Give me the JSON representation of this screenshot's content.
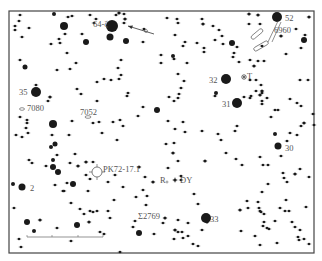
{
  "chart": {
    "type": "star-chart",
    "frame": {
      "x": 9,
      "y": 11,
      "width": 305,
      "height": 242,
      "stroke": "#444444"
    },
    "star_color": "#1a1a1a",
    "label_color": "#555555",
    "scale_bar": {
      "x1": 27,
      "x2": 103,
      "y": 237,
      "ticks": [
        27,
        52,
        78,
        103
      ]
    }
  },
  "labels": [
    {
      "id": "64-zeta",
      "text": "64-ζ",
      "x": 93,
      "y": 27
    },
    {
      "id": "52",
      "text": "52",
      "x": 285,
      "y": 21
    },
    {
      "id": "6960",
      "text": "6960",
      "x": 274,
      "y": 33
    },
    {
      "id": "35",
      "text": "35",
      "x": 19,
      "y": 95
    },
    {
      "id": "7080",
      "text": "7080",
      "x": 27,
      "y": 111
    },
    {
      "id": "7052",
      "text": "7052",
      "x": 80,
      "y": 115
    },
    {
      "id": "32",
      "text": "32",
      "x": 209,
      "y": 83
    },
    {
      "id": "T",
      "text": "T",
      "x": 247,
      "y": 79
    },
    {
      "id": "31",
      "text": "31",
      "x": 222,
      "y": 107
    },
    {
      "id": "30",
      "text": "30",
      "x": 285,
      "y": 151
    },
    {
      "id": "2",
      "text": "2",
      "x": 30,
      "y": 191
    },
    {
      "id": "PK72-17.1",
      "text": "PK72-17.1",
      "x": 103,
      "y": 172
    },
    {
      "id": "R",
      "text": "R",
      "x": 160,
      "y": 183
    },
    {
      "id": "DY",
      "text": "DY",
      "x": 180,
      "y": 183
    },
    {
      "id": "Sigma2769",
      "text": "Σ2769",
      "x": 138,
      "y": 219
    },
    {
      "id": "33",
      "text": "33",
      "x": 210,
      "y": 222
    }
  ],
  "stars": [
    [
      20,
      15,
      1.2
    ],
    [
      19,
      21,
      1.2
    ],
    [
      15,
      26,
      1.2
    ],
    [
      15,
      30,
      1.2
    ],
    [
      29,
      28,
      1.2
    ],
    [
      22,
      37,
      1.2
    ],
    [
      54,
      14,
      2
    ],
    [
      68,
      17,
      1.2
    ],
    [
      72,
      16,
      1.2
    ],
    [
      64,
      26,
      4
    ],
    [
      65,
      34,
      1.2
    ],
    [
      90,
      15,
      1.2
    ],
    [
      96,
      19,
      1.2
    ],
    [
      94,
      23,
      1.2
    ],
    [
      112,
      26,
      6
    ],
    [
      110,
      37,
      3.5
    ],
    [
      119,
      13,
      1.5
    ],
    [
      116,
      15,
      1.2
    ],
    [
      124,
      14,
      1.2
    ],
    [
      125,
      19,
      1.5
    ],
    [
      124,
      23,
      1.2
    ],
    [
      126,
      41,
      3
    ],
    [
      144,
      29,
      1.2
    ],
    [
      143,
      42,
      1.2
    ],
    [
      86,
      42,
      3
    ],
    [
      82,
      34,
      1.2
    ],
    [
      51,
      44,
      1.2
    ],
    [
      60,
      43,
      1.2
    ],
    [
      59,
      39,
      1.2
    ],
    [
      67,
      53,
      1.2
    ],
    [
      76,
      63,
      1.2
    ],
    [
      70,
      69,
      1.2
    ],
    [
      57,
      70,
      1.2
    ],
    [
      20,
      60,
      1.2
    ],
    [
      25,
      67,
      2.5
    ],
    [
      121,
      60,
      1.2
    ],
    [
      118,
      68,
      1.2
    ],
    [
      121,
      75,
      1.2
    ],
    [
      119,
      79,
      1.2
    ],
    [
      111,
      80,
      1.2
    ],
    [
      104,
      79,
      1.2
    ],
    [
      97,
      82,
      1.2
    ],
    [
      36,
      85,
      1.2
    ],
    [
      36,
      92,
      5
    ],
    [
      50,
      97,
      1.5
    ],
    [
      48,
      101,
      1.2
    ],
    [
      77,
      89,
      1.2
    ],
    [
      81,
      94,
      1.2
    ],
    [
      128,
      93,
      1.2
    ],
    [
      127,
      96,
      1.2
    ],
    [
      97,
      101,
      1.2
    ],
    [
      143,
      107,
      1.2
    ],
    [
      138,
      116,
      1.2
    ],
    [
      157,
      110,
      3
    ],
    [
      166,
      7,
      1.2
    ],
    [
      167,
      18,
      1.2
    ],
    [
      177,
      19,
      1.2
    ],
    [
      178,
      23,
      1.2
    ],
    [
      202,
      19,
      1.2
    ],
    [
      203,
      24,
      1.5
    ],
    [
      213,
      26,
      1.2
    ],
    [
      175,
      35,
      1.2
    ],
    [
      185,
      42,
      1.2
    ],
    [
      183,
      46,
      1.2
    ],
    [
      197,
      43,
      1.2
    ],
    [
      204,
      48,
      1.2
    ],
    [
      204,
      52,
      1.2
    ],
    [
      173,
      56,
      2
    ],
    [
      174,
      59,
      1.2
    ],
    [
      187,
      63,
      1.2
    ],
    [
      161,
      55,
      1.2
    ],
    [
      161,
      63,
      1.2
    ],
    [
      178,
      74,
      1.2
    ],
    [
      184,
      81,
      1.2
    ],
    [
      181,
      88,
      1.2
    ],
    [
      179,
      94,
      1.2
    ],
    [
      178,
      98,
      1.2
    ],
    [
      174,
      101,
      1.2
    ],
    [
      169,
      97,
      1.2
    ],
    [
      215,
      40,
      1.2
    ],
    [
      232,
      43,
      3
    ],
    [
      237,
      47,
      1.2
    ],
    [
      234,
      53,
      1.2
    ],
    [
      233,
      57,
      1.2
    ],
    [
      239,
      62,
      1.2
    ],
    [
      219,
      30,
      1.2
    ],
    [
      222,
      36,
      1.2
    ],
    [
      223,
      44,
      1.2
    ],
    [
      249,
      14,
      1.5
    ],
    [
      258,
      15,
      1.5
    ],
    [
      249,
      24,
      1.2
    ],
    [
      260,
      24,
      1.2
    ],
    [
      277,
      17,
      5
    ],
    [
      309,
      17,
      1.5
    ],
    [
      296,
      29,
      1.2
    ],
    [
      281,
      36,
      1.5
    ],
    [
      262,
      46,
      1.2
    ],
    [
      305,
      35,
      1.2
    ],
    [
      304,
      40,
      3
    ],
    [
      301,
      48,
      1.2
    ],
    [
      286,
      54,
      1.2
    ],
    [
      250,
      60,
      1.2
    ],
    [
      254,
      66,
      1.5
    ],
    [
      258,
      61,
      1.2
    ],
    [
      264,
      61,
      1.2
    ],
    [
      250,
      80,
      1.2
    ],
    [
      256,
      80,
      1.2
    ],
    [
      261,
      85,
      1.2
    ],
    [
      262,
      91,
      1.5
    ],
    [
      260,
      95,
      1.5
    ],
    [
      262,
      93,
      1.2
    ],
    [
      226,
      79,
      5
    ],
    [
      216,
      93,
      2
    ],
    [
      215,
      96,
      1.2
    ],
    [
      237,
      103,
      5
    ],
    [
      244,
      97,
      1.2
    ],
    [
      250,
      98,
      1.2
    ],
    [
      251,
      96,
      1.2
    ],
    [
      256,
      91,
      1.2
    ],
    [
      267,
      98,
      1.2
    ],
    [
      262,
      104,
      1.2
    ],
    [
      262,
      101,
      1.2
    ],
    [
      300,
      80,
      1.2
    ],
    [
      308,
      80,
      1.2
    ],
    [
      301,
      106,
      1.2
    ],
    [
      297,
      103,
      1.2
    ],
    [
      290,
      99,
      1.2
    ],
    [
      275,
      110,
      1.2
    ],
    [
      313,
      114,
      1.2
    ],
    [
      314,
      125,
      1.2
    ],
    [
      20,
      117,
      1.2
    ],
    [
      27,
      120,
      1.2
    ],
    [
      27,
      123,
      1.2
    ],
    [
      26,
      128,
      1.2
    ],
    [
      53,
      124,
      4
    ],
    [
      72,
      121,
      1.2
    ],
    [
      93,
      123,
      1.2
    ],
    [
      99,
      122,
      1.2
    ],
    [
      113,
      122,
      1.2
    ],
    [
      120,
      120,
      1.2
    ],
    [
      123,
      126,
      1.2
    ],
    [
      168,
      121,
      1.2
    ],
    [
      175,
      129,
      1.2
    ],
    [
      183,
      122,
      1.2
    ],
    [
      271,
      117,
      1.2
    ],
    [
      278,
      110,
      1.2
    ],
    [
      304,
      123,
      1.5
    ],
    [
      301,
      126,
      1.2
    ],
    [
      297,
      135,
      1.2
    ],
    [
      237,
      126,
      1.2
    ],
    [
      16,
      135,
      1.2
    ],
    [
      22,
      137,
      1.2
    ],
    [
      28,
      133,
      1.2
    ],
    [
      52,
      135,
      1.2
    ],
    [
      69,
      135,
      1.2
    ],
    [
      55,
      144,
      2.5
    ],
    [
      102,
      133,
      1.2
    ],
    [
      117,
      140,
      1.2
    ],
    [
      51,
      147,
      2
    ],
    [
      75,
      154,
      1.2
    ],
    [
      57,
      155,
      1.2
    ],
    [
      53,
      160,
      2
    ],
    [
      86,
      162,
      1.5
    ],
    [
      29,
      160,
      1.2
    ],
    [
      32,
      163,
      1.2
    ],
    [
      46,
      166,
      1.2
    ],
    [
      78,
      166,
      1.5
    ],
    [
      53,
      167,
      3
    ],
    [
      58,
      172,
      3
    ],
    [
      70,
      163,
      1.2
    ],
    [
      86,
      175,
      1.2
    ],
    [
      90,
      179,
      1.2
    ],
    [
      55,
      185,
      1.2
    ],
    [
      67,
      183,
      1.2
    ],
    [
      73,
      183,
      1.2
    ],
    [
      73,
      184,
      3
    ],
    [
      63,
      191,
      1.2
    ],
    [
      13,
      184,
      2
    ],
    [
      22,
      187,
      3.5
    ],
    [
      64,
      191,
      1.2
    ],
    [
      88,
      191,
      1.2
    ],
    [
      108,
      182,
      1.2
    ],
    [
      115,
      175,
      1.2
    ],
    [
      123,
      187,
      1.2
    ],
    [
      139,
      167,
      1.5
    ],
    [
      145,
      177,
      1.2
    ],
    [
      153,
      182,
      1.5
    ],
    [
      143,
      190,
      1.2
    ],
    [
      147,
      196,
      1.2
    ],
    [
      136,
      197,
      1.2
    ],
    [
      146,
      205,
      1.2
    ],
    [
      93,
      162,
      1.2
    ],
    [
      71,
      203,
      1.2
    ],
    [
      80,
      209,
      1.2
    ],
    [
      90,
      211,
      1.2
    ],
    [
      84,
      214,
      1.2
    ],
    [
      93,
      212,
      1.2
    ],
    [
      97,
      211,
      1.2
    ],
    [
      108,
      211,
      1.2
    ],
    [
      114,
      200,
      1.2
    ],
    [
      14,
      208,
      1.2
    ],
    [
      27,
      222,
      3
    ],
    [
      40,
      220,
      1.5
    ],
    [
      34,
      231,
      2
    ],
    [
      57,
      228,
      1.2
    ],
    [
      77,
      225,
      3
    ],
    [
      89,
      222,
      1.5
    ],
    [
      110,
      218,
      1.2
    ],
    [
      100,
      232,
      1.2
    ],
    [
      104,
      234,
      1.2
    ],
    [
      19,
      239,
      1.2
    ],
    [
      21,
      247,
      1.2
    ],
    [
      15,
      255,
      1.2
    ],
    [
      25,
      258,
      1.2
    ],
    [
      71,
      241,
      1.2
    ],
    [
      120,
      252,
      1.2
    ],
    [
      166,
      144,
      1.2
    ],
    [
      174,
      143,
      1.2
    ],
    [
      185,
      132,
      1.2
    ],
    [
      202,
      131,
      1.2
    ],
    [
      218,
      134,
      1.2
    ],
    [
      221,
      140,
      1.2
    ],
    [
      235,
      131,
      1.2
    ],
    [
      275,
      134,
      2
    ],
    [
      290,
      133,
      1.2
    ],
    [
      287,
      141,
      1.2
    ],
    [
      278,
      146,
      3.5
    ],
    [
      281,
      156,
      1.2
    ],
    [
      226,
      153,
      1.2
    ],
    [
      236,
      159,
      1.2
    ],
    [
      173,
      153,
      1.5
    ],
    [
      178,
      161,
      1.2
    ],
    [
      205,
      161,
      1.5
    ],
    [
      260,
      157,
      1.2
    ],
    [
      242,
      165,
      1.2
    ],
    [
      263,
      165,
      1.2
    ],
    [
      268,
      165,
      1.2
    ],
    [
      283,
      173,
      1.2
    ],
    [
      284,
      178,
      1.2
    ],
    [
      287,
      182,
      1.2
    ],
    [
      295,
      174,
      1.5
    ],
    [
      300,
      169,
      1.2
    ],
    [
      309,
      177,
      1.2
    ],
    [
      268,
      184,
      1.2
    ],
    [
      262,
      192,
      1.2
    ],
    [
      258,
      202,
      1.2
    ],
    [
      247,
      201,
      1.2
    ],
    [
      248,
      208,
      1.2
    ],
    [
      240,
      210,
      1.5
    ],
    [
      259,
      208,
      1.2
    ],
    [
      261,
      212,
      1.2
    ],
    [
      168,
      168,
      1.2
    ],
    [
      181,
      176,
      1.2
    ],
    [
      181,
      180,
      1.2
    ],
    [
      194,
      194,
      1.2
    ],
    [
      198,
      204,
      1.2
    ],
    [
      188,
      223,
      1.2
    ],
    [
      165,
      218,
      1.5
    ],
    [
      206,
      218,
      5
    ],
    [
      178,
      220,
      1.2
    ],
    [
      175,
      230,
      1.5
    ],
    [
      178,
      232,
      1.2
    ],
    [
      182,
      232,
      1.2
    ],
    [
      188,
      236,
      1.2
    ],
    [
      174,
      239,
      1.2
    ],
    [
      202,
      230,
      1.2
    ],
    [
      241,
      231,
      1.2
    ],
    [
      260,
      211,
      1.2
    ],
    [
      264,
      214,
      1.2
    ],
    [
      264,
      222,
      1.2
    ],
    [
      263,
      226,
      1.2
    ],
    [
      269,
      229,
      1.2
    ],
    [
      289,
      211,
      1.2
    ],
    [
      292,
      222,
      1.2
    ],
    [
      295,
      227,
      1.2
    ],
    [
      300,
      230,
      1.2
    ],
    [
      298,
      237,
      1.2
    ],
    [
      304,
      239,
      1.2
    ],
    [
      299,
      240,
      1.2
    ],
    [
      255,
      236,
      1.2
    ],
    [
      260,
      245,
      1.2
    ],
    [
      277,
      243,
      1.2
    ],
    [
      267,
      228,
      1.2
    ],
    [
      309,
      244,
      1.2
    ],
    [
      280,
      208,
      1.2
    ],
    [
      285,
      211,
      1.2
    ],
    [
      193,
      244,
      1.2
    ],
    [
      183,
      238,
      1.2
    ],
    [
      139,
      233,
      3
    ],
    [
      133,
      227,
      1.2
    ],
    [
      135,
      221,
      1.2
    ],
    [
      154,
      234,
      1.2
    ],
    [
      163,
      223,
      1.2
    ],
    [
      198,
      246,
      1.2
    ],
    [
      207,
      222,
      1.5
    ],
    [
      286,
      200,
      1.2
    ],
    [
      306,
      207,
      1.2
    ],
    [
      275,
      221,
      1.2
    ]
  ],
  "markers": {
    "arrow": {
      "x1": 154,
      "y1": 34,
      "x2": 128,
      "y2": 26
    },
    "arrow_target": {
      "x": 146,
      "y": 31
    },
    "T_variable": {
      "x": 244,
      "y": 77
    },
    "DY_variable": {
      "x": 175,
      "y": 180
    },
    "R_variable": {
      "x": 167,
      "y": 181
    },
    "planetary_nebula": {
      "x": 97,
      "y": 172,
      "r": 5
    },
    "galaxy_7080": {
      "x": 22,
      "y": 109
    },
    "galaxy_7052": {
      "x": 88,
      "y": 117
    },
    "nebula_6960": [
      {
        "x": 257,
        "y": 34,
        "w": 14,
        "h": 4,
        "rot": -40
      },
      {
        "x": 261,
        "y": 46,
        "w": 16,
        "h": 4,
        "rot": -30
      }
    ]
  }
}
